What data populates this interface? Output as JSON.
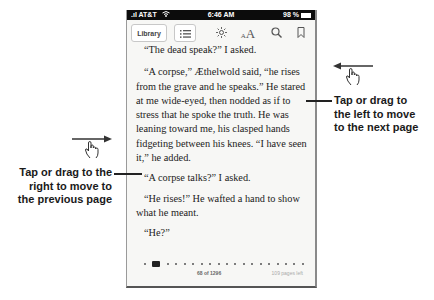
{
  "status_bar": {
    "carrier": "AT&T",
    "time": "6:46 AM",
    "battery": "98 %"
  },
  "toolbar": {
    "library_label": "Library",
    "icons": [
      "list-icon",
      "brightness-icon",
      "font-size-icon",
      "search-icon",
      "bookmark-icon"
    ],
    "font_size_label_small": "A",
    "font_size_label_large": "A"
  },
  "page": {
    "paragraphs": [
      "“The dead speak?” I asked.",
      "“A corpse,” Æthelwold said, “he rises from the grave and he speaks.” He stared at me wide-eyed, then nodded as if to stress that he spoke the truth. He was leaning toward me, his clasped hands fidgeting between his knees. “I have seen it,” he added.",
      "“A corpse talks?” I asked.",
      "“He rises!” He wafted a hand to show what he meant.",
      "“He?”"
    ],
    "page_number": "68 of 1296",
    "pages_left": "109 pages left"
  },
  "callouts": {
    "next": {
      "line1": "Tap or drag to",
      "line2": "the left to move",
      "line3": "to the next page"
    },
    "previous": {
      "line1": "Tap or drag to the",
      "line2": "right to move to",
      "line3": "the previous page"
    }
  },
  "colors": {
    "status_bar": "#0c0c0c",
    "page_bg": "#f7f7f5",
    "text": "#222222"
  }
}
